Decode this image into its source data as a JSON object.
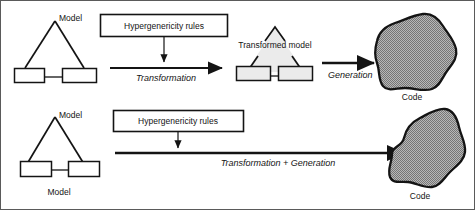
{
  "figure": {
    "background": "#ffffff",
    "outline_color": "#141414",
    "fill_gray": "#9e9e9e",
    "fill_light_gray": "#e6e6e6"
  },
  "rows": [
    {
      "id": "row-top",
      "source_model": {
        "label": "Model",
        "shape": "triangle-with-two-boxes",
        "filled": false
      },
      "rules_box": {
        "label": "Hypergenericity rules"
      },
      "arrow": {
        "label": "Transformation"
      },
      "target_model": {
        "label": "Transformed model",
        "shape": "triangle-with-two-boxes",
        "filled": true
      },
      "second_arrow": {
        "label": "Generation"
      },
      "code": {
        "label": "Code",
        "shape": "blob"
      }
    },
    {
      "id": "row-bottom",
      "source_model": {
        "label": "Model",
        "caption": "Model",
        "shape": "triangle-with-two-boxes",
        "filled": false
      },
      "rules_box": {
        "label": "Hypergenericity rules"
      },
      "arrow": {
        "label": "Transformation + Generation"
      },
      "code": {
        "label": "Code",
        "shape": "blob"
      }
    }
  ]
}
